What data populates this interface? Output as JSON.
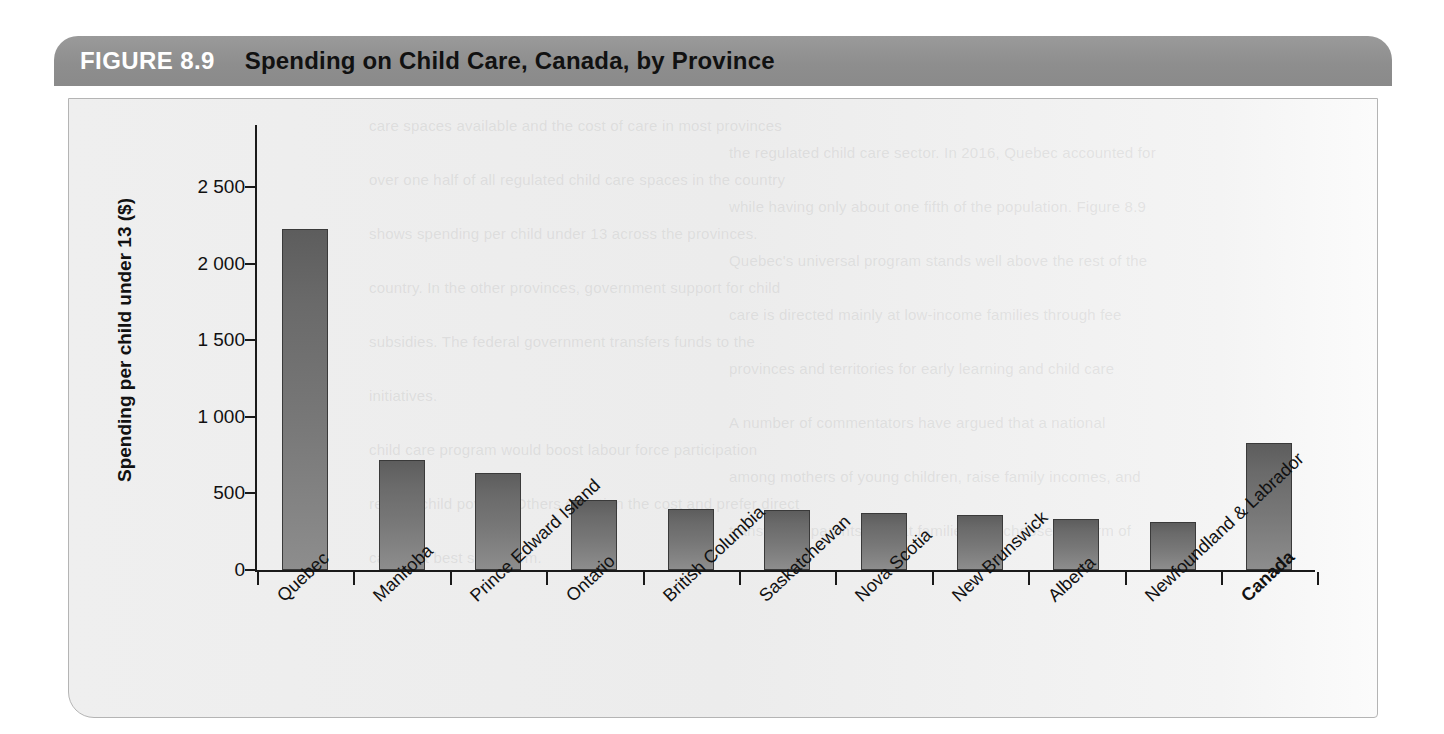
{
  "figure": {
    "number": "FIGURE 8.9",
    "title": "Spending on Child Care, Canada, by Province"
  },
  "chart_data": {
    "type": "bar",
    "title": "Spending on Child Care, Canada, by Province",
    "xlabel": "",
    "ylabel": "Spending per child under 13 ($)",
    "ylim": [
      0,
      2500
    ],
    "ytick_labels": [
      "2 500",
      "2 000",
      "1 500",
      "1 000",
      "500",
      "0"
    ],
    "ytick_values": [
      2500,
      2000,
      1500,
      1000,
      500,
      0
    ],
    "grid": false,
    "legend": null,
    "categories": [
      "Quebec",
      "Manitoba",
      "Prince Edward Island",
      "Ontario",
      "British Columbia",
      "Saskatchewan",
      "Nova Scotia",
      "New Brunswick",
      "Alberta",
      "Newfoundland & Labrador",
      "Canada"
    ],
    "values": [
      2225,
      715,
      635,
      460,
      395,
      392,
      370,
      358,
      333,
      315,
      832
    ],
    "emphasized_categories": [
      "Canada"
    ],
    "bar_color_top": "#5d5d5d",
    "bar_color_bottom": "#8d8d8d",
    "bar_border_color": "#3a3a3a"
  },
  "style": {
    "header_bg": "#8e8e8e",
    "header_number_color": "#ffffff",
    "header_title_color": "#111111",
    "panel_bg": "#ececec",
    "axis_color": "#1a1a1a"
  },
  "background_text": {
    "lines": [
      "care spaces available and the cost of care in most provinces",
      "the regulated child care sector. In 2016, Quebec accounted for",
      "over one half of all regulated child care spaces in the country",
      "while having only about one fifth of the population. Figure 8.9",
      "shows spending per child under 13 across the provinces.",
      "Quebec's universal program stands well above the rest of the",
      "country. In the other provinces, government support for child",
      "care is directed mainly at low-income families through fee",
      "subsidies. The federal government transfers funds to the",
      "provinces and territories for early learning and child care",
      "initiatives.",
      "A number of commentators have argued that a national",
      "child care program would boost labour force participation",
      "among mothers of young children, raise family incomes, and",
      "reduce child poverty. Others question the cost and prefer direct",
      "transfers to parents so that families can choose the form of",
      "care that best suits them."
    ]
  }
}
